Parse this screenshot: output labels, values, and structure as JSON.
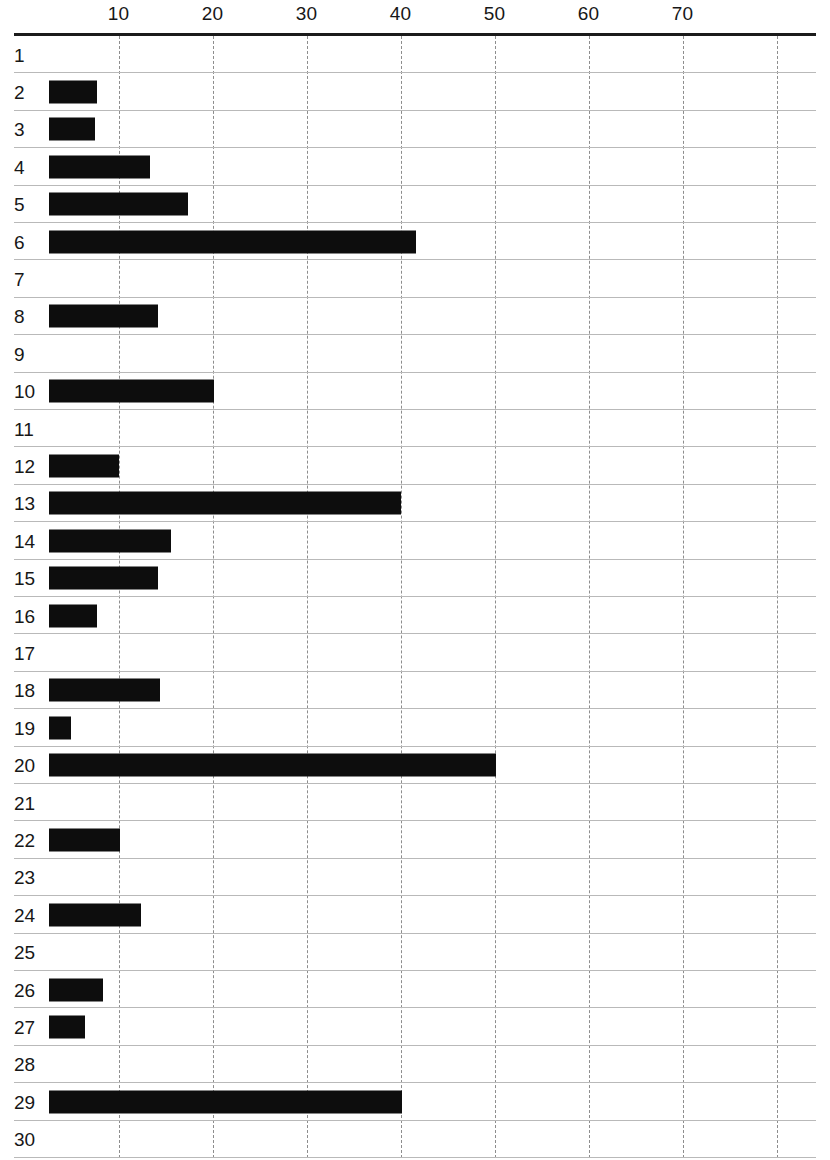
{
  "chart_data": {
    "type": "bar",
    "orientation": "horizontal",
    "title": "",
    "subtitle": "",
    "xlabel": "",
    "ylabel": "",
    "xlim": [
      0,
      80
    ],
    "ylim": null,
    "grid": true,
    "grid_axis": "x",
    "legend": false,
    "legend_position": "none",
    "bar_color": "#0d0d0d",
    "bar_start_value": 2.6,
    "categories": [
      "1",
      "2",
      "3",
      "4",
      "5",
      "6",
      "7",
      "8",
      "9",
      "10",
      "11",
      "12",
      "13",
      "14",
      "15",
      "16",
      "17",
      "18",
      "19",
      "20",
      "21",
      "22",
      "23",
      "24",
      "25",
      "26",
      "27",
      "28",
      "29",
      "30"
    ],
    "values": [
      0,
      7.7,
      7.5,
      13.3,
      17.4,
      41.6,
      0,
      14.2,
      0,
      20.2,
      0,
      10.0,
      40.0,
      15.6,
      14.2,
      7.7,
      0,
      14.4,
      4.9,
      50.1,
      0,
      10.1,
      0,
      12.4,
      0,
      8.3,
      6.4,
      0,
      40.2,
      0
    ],
    "x_ticks": [
      10,
      20,
      30,
      40,
      50,
      60,
      70
    ],
    "x_tick_labels": [
      "10",
      "20",
      "30",
      "40",
      "50",
      "60",
      "70"
    ],
    "gridline_values": [
      10,
      20,
      30,
      40,
      50,
      60,
      70,
      80
    ],
    "axis_color": "#1b1b1b",
    "gridline_color": "#8d8d8d",
    "row_separator_color": "#b9b9b9",
    "background_color": "#ffffff"
  }
}
